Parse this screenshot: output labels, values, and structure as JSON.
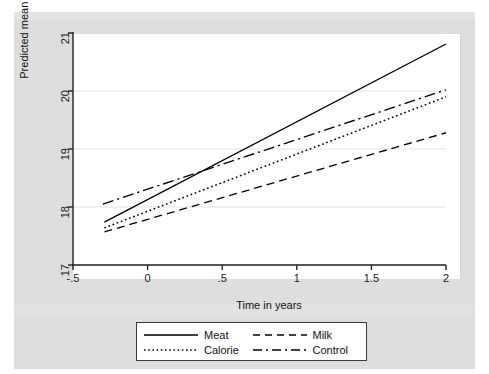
{
  "figure": {
    "top_caption_fragment": "",
    "background_color": "#dedede",
    "plot_background_color": "#ffffff"
  },
  "chart_data": {
    "type": "line",
    "title": "",
    "subtitle": "",
    "xlabel": "Time in years",
    "ylabel": "Predicted mean Raven's score",
    "xlim": [
      -0.5,
      2
    ],
    "ylim": [
      17,
      21
    ],
    "xticks": [
      -0.5,
      0,
      0.5,
      1,
      1.5,
      2
    ],
    "xticklabels": [
      "-.5",
      "0",
      ".5",
      "1",
      "1.5",
      "2"
    ],
    "yticks": [
      17,
      18,
      19,
      20,
      21
    ],
    "yticklabels": [
      "17",
      "18",
      "19",
      "20",
      "21"
    ],
    "grid": "horizontal",
    "legend_position": "below-axes",
    "series": [
      {
        "name": "Meat",
        "linestyle": "solid",
        "color": "#000000",
        "x": [
          -0.29,
          2.0
        ],
        "values": [
          17.74,
          20.81
        ]
      },
      {
        "name": "Milk",
        "linestyle": "dashed",
        "color": "#000000",
        "x": [
          -0.29,
          2.0
        ],
        "values": [
          17.57,
          19.28
        ]
      },
      {
        "name": "Calorie",
        "linestyle": "dotted",
        "color": "#000000",
        "x": [
          -0.29,
          2.0
        ],
        "values": [
          17.64,
          19.9
        ]
      },
      {
        "name": "Control",
        "linestyle": "dashdot",
        "color": "#000000",
        "x": [
          -0.3,
          2.0
        ],
        "values": [
          18.05,
          20.02
        ]
      }
    ]
  },
  "legend": {
    "entries": [
      {
        "label": "Meat",
        "style": "solid"
      },
      {
        "label": "Milk",
        "style": "dashed"
      },
      {
        "label": "Calorie",
        "style": "dotted"
      },
      {
        "label": "Control",
        "style": "dashdot"
      }
    ]
  }
}
